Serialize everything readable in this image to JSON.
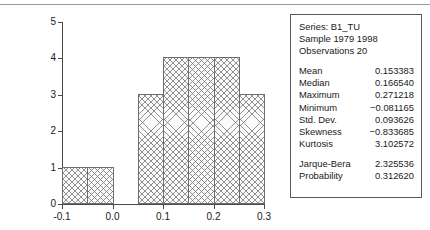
{
  "chart_data": {
    "type": "bar",
    "title": "",
    "xlabel": "",
    "ylabel": "",
    "xlim": [
      -0.1,
      0.3
    ],
    "ylim": [
      0,
      5
    ],
    "grid": false,
    "legend": "none",
    "bin_width": 0.05,
    "categories": [
      "-0.10 to -0.05",
      "-0.05 to 0.00",
      "0.00 to 0.05",
      "0.05 to 0.10",
      "0.10 to 0.15",
      "0.15 to 0.20",
      "0.20 to 0.25",
      "0.25 to 0.30"
    ],
    "bin_edges": [
      -0.1,
      -0.05,
      0.0,
      0.05,
      0.1,
      0.15,
      0.2,
      0.25,
      0.3
    ],
    "values": [
      1,
      1,
      0,
      3,
      4,
      4,
      4,
      3
    ],
    "xticks": [
      "-0.1",
      "0.0",
      "0.1",
      "0.2",
      "0.3"
    ],
    "xtick_values": [
      -0.1,
      0.0,
      0.1,
      0.2,
      0.3
    ],
    "yticks": [
      "0",
      "1",
      "2",
      "3",
      "4",
      "5"
    ],
    "ytick_values": [
      0,
      1,
      2,
      3,
      4,
      5
    ]
  },
  "stats_panel": {
    "header": [
      "Series: B1_TU",
      "Sample 1979 1998",
      "Observations 20"
    ],
    "rows": [
      {
        "label": "Mean",
        "value": "0.153383"
      },
      {
        "label": "Median",
        "value": "0.166540"
      },
      {
        "label": "Maximum",
        "value": "0.271218"
      },
      {
        "label": "Minimum",
        "value": "−0.081165"
      },
      {
        "label": "Std. Dev.",
        "value": "0.093626"
      },
      {
        "label": "Skewness",
        "value": "−0.833685"
      },
      {
        "label": "Kurtosis",
        "value": "3.102572"
      }
    ],
    "test_rows": [
      {
        "label": "Jarque-Bera",
        "value": "2.325536"
      },
      {
        "label": "Probability",
        "value": "0.312620"
      }
    ]
  },
  "colors": {
    "axis": "#4a4a4a",
    "bar_border": "#6e6e6e",
    "bar_fill": "#fbfbfb",
    "panel_border": "#5a5a5a",
    "rule": "#9a9a9a",
    "text": "#1a1a1a"
  }
}
